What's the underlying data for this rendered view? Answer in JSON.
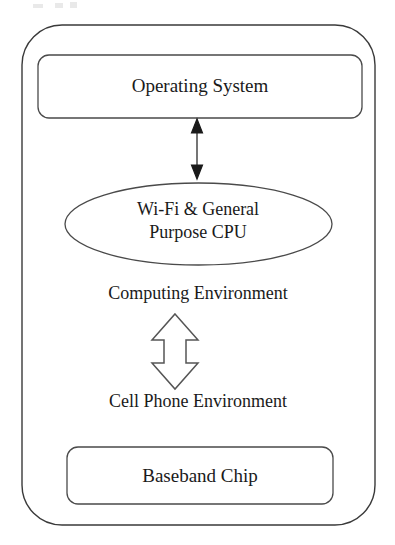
{
  "diagram": {
    "type": "block-diagram",
    "title_visible": false,
    "device_container": {
      "name": "device-outline",
      "shape": "rounded-rectangle"
    },
    "nodes": [
      {
        "id": "operating-system",
        "label": "Operating System",
        "shape": "rounded-rectangle"
      },
      {
        "id": "wifi-general-purpose-cpu",
        "label": "Wi-Fi & General Purpose CPU",
        "label_line1": "Wi-Fi & General",
        "label_line2": "Purpose CPU",
        "shape": "ellipse"
      },
      {
        "id": "baseband-chip",
        "label": "Baseband Chip",
        "shape": "rounded-rectangle"
      }
    ],
    "region_labels": [
      {
        "id": "computing-environment",
        "label": "Computing Environment"
      },
      {
        "id": "cell-phone-environment",
        "label": "Cell Phone Environment"
      }
    ],
    "connectors": [
      {
        "id": "os-cpu-connector",
        "style": "solid-double-arrow",
        "direction": "bidirectional",
        "from": "operating-system",
        "to": "wifi-general-purpose-cpu"
      },
      {
        "id": "environment-connector",
        "style": "hollow-block-double-arrow",
        "direction": "bidirectional",
        "from": "computing-environment",
        "to": "cell-phone-environment"
      }
    ],
    "colors": {
      "background": "#ffffff",
      "stroke": "#3a3a3a",
      "text": "#1a1a1a",
      "hollow_arrow_fill": "#ffffff",
      "hollow_arrow_stroke": "#555555"
    }
  }
}
